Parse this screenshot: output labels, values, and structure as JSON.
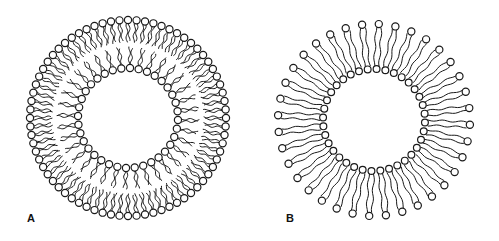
{
  "figure": {
    "background": "#ffffff",
    "ink_color": "#1a1a1a",
    "panels": [
      {
        "id": "A",
        "label": "A",
        "description": "Lipid bilayer vesicle (liposome)",
        "center": [
          128,
          118
        ],
        "outer_leaflet": {
          "count": 72,
          "head_radius_px": 3.6,
          "head_ring_radius": 98,
          "tail_inner_radius": 76
        },
        "inner_leaflet": {
          "count": 36,
          "head_radius_px": 3.6,
          "head_ring_radius": 50,
          "tail_outer_radius": 71
        }
      },
      {
        "id": "B",
        "label": "B",
        "description": "Monolayer vesicle of bipolar (bolaamphiphile) lipids",
        "center": [
          374,
          120
        ],
        "molecules": {
          "count": 36,
          "outer_head_radius_px": 3.6,
          "inner_head_radius_px": 3.4,
          "outer_ring_radius": 96,
          "inner_ring_radius": 51,
          "tail_spacing_px": 2.6
        }
      }
    ]
  }
}
